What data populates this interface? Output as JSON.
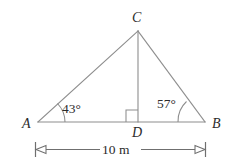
{
  "figure": {
    "background_color": "#ffffff",
    "line_color": "#8d8d8d",
    "text_color": "#2b2b2b",
    "vertices": [
      {
        "name": "vertex-label-a",
        "label": "A",
        "x": 38,
        "y": 122
      },
      {
        "name": "vertex-label-b",
        "label": "B",
        "x": 205,
        "y": 122
      },
      {
        "name": "vertex-label-c",
        "label": "C",
        "x": 138,
        "y": 30
      },
      {
        "name": "vertex-label-d",
        "label": "D",
        "x": 138,
        "y": 122
      }
    ],
    "labels": {
      "vertex_a": "A",
      "vertex_b": "B",
      "vertex_c": "C",
      "vertex_d": "D",
      "angle_a": "43°",
      "angle_b": "57°",
      "dimension": "10 m"
    },
    "angles": {
      "at_a": {
        "value": 43,
        "unit": "degrees",
        "text": "43°"
      },
      "at_b": {
        "value": 57,
        "unit": "degrees",
        "text": "57°"
      },
      "at_d": {
        "value": 90,
        "unit": "degrees",
        "text": "right angle"
      }
    },
    "dimension_line": {
      "label": "10 m",
      "measures": "AB",
      "value": 10,
      "unit": "m",
      "arrow_style": "outward-hollow-triangles-with-end-ticks"
    },
    "segments": [
      {
        "name": "segment-ab",
        "from": "A",
        "to": "B"
      },
      {
        "name": "segment-ac",
        "from": "A",
        "to": "C"
      },
      {
        "name": "segment-bc",
        "from": "B",
        "to": "C"
      },
      {
        "name": "segment-cd",
        "from": "C",
        "to": "D"
      }
    ]
  }
}
